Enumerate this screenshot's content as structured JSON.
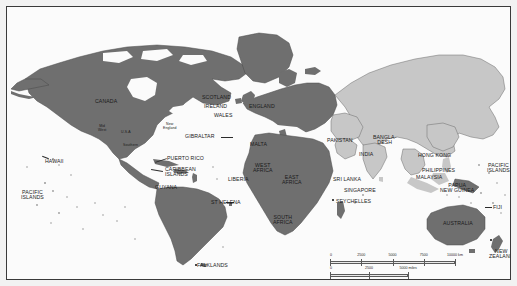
{
  "figure": {
    "name": "world-map",
    "kind": "map",
    "projection_note": "equirectangular world map",
    "colors": {
      "land_dark": "#6f6f6f",
      "land_light": "#c7c7c7",
      "ocean": "#fbfbfb",
      "outline": "#4a4a4a",
      "label_text": "#1a1a1a",
      "frame": "#3a3a3a",
      "page_background": "#f2f2f2"
    }
  },
  "labels": [
    {
      "id": "canada",
      "text": "CANADA",
      "style": "caps"
    },
    {
      "id": "usa",
      "text": "U.S.A",
      "style": "xs"
    },
    {
      "id": "mid-west",
      "text": "Mid\nWest",
      "style": "xs"
    },
    {
      "id": "new-england",
      "text": "New\nEngland",
      "style": "xs"
    },
    {
      "id": "southern",
      "text": "Southern",
      "style": "xs"
    },
    {
      "id": "hawaii",
      "text": "HAWAII",
      "style": "caps"
    },
    {
      "id": "pacific-islands-e",
      "text": "PACIFIC\nISLANDS",
      "style": "caps"
    },
    {
      "id": "puerto-rico",
      "text": "PUERTO RICO",
      "style": "caps"
    },
    {
      "id": "caribbean-islands",
      "text": "CARIBBEAN\nISLANDS",
      "style": "caps"
    },
    {
      "id": "guyana",
      "text": "GUYANA",
      "style": "caps"
    },
    {
      "id": "falklands",
      "text": "FALKLANDS",
      "style": "caps"
    },
    {
      "id": "scotland",
      "text": "SCOTLAND",
      "style": "caps"
    },
    {
      "id": "ireland",
      "text": "IRELAND",
      "style": "caps"
    },
    {
      "id": "wales",
      "text": "WALES",
      "style": "caps"
    },
    {
      "id": "england",
      "text": "ENGLAND",
      "style": "caps"
    },
    {
      "id": "gibraltar",
      "text": "GIBRALTAR",
      "style": "caps"
    },
    {
      "id": "malta",
      "text": "MALTA",
      "style": "caps"
    },
    {
      "id": "st-helena",
      "text": "ST HELENA",
      "style": "caps"
    },
    {
      "id": "liberia",
      "text": "LIBERIA",
      "style": "caps"
    },
    {
      "id": "west-africa",
      "text": "WEST\nAFRICA",
      "style": "caps"
    },
    {
      "id": "east-africa",
      "text": "EAST\nAFRICA",
      "style": "caps"
    },
    {
      "id": "south-africa",
      "text": "SOUTH\nAFRICA",
      "style": "caps"
    },
    {
      "id": "seychelles",
      "text": "SEYCHELLES",
      "style": "caps"
    },
    {
      "id": "pakistan",
      "text": "PAKISTAN",
      "style": "caps"
    },
    {
      "id": "india",
      "text": "INDIA",
      "style": "caps"
    },
    {
      "id": "bangladesh",
      "text": "BANGLA-\nDESH",
      "style": "caps"
    },
    {
      "id": "sri-lanka",
      "text": "SRI LANKA",
      "style": "caps"
    },
    {
      "id": "singapore",
      "text": "SINGAPORE",
      "style": "caps"
    },
    {
      "id": "malaysia",
      "text": "MALAYSIA",
      "style": "caps"
    },
    {
      "id": "hong-kong",
      "text": "HONG KONG",
      "style": "caps"
    },
    {
      "id": "philippines",
      "text": "PHILIPPINES",
      "style": "caps"
    },
    {
      "id": "papua-new-guinea",
      "text": "PAPUA\nNEW GUINEA",
      "style": "caps"
    },
    {
      "id": "pacific-islands-w",
      "text": "PACIFIC\nISLANDS",
      "style": "caps"
    },
    {
      "id": "fiji",
      "text": "FIJI",
      "style": "caps"
    },
    {
      "id": "australia",
      "text": "AUSTRALIA",
      "style": "caps"
    },
    {
      "id": "new-zealand",
      "text": "NEW\nZEALAND",
      "style": "caps"
    }
  ],
  "scale": {
    "name": "map-scale",
    "km": {
      "unit_label": "10000 km",
      "ticks": [
        "0",
        "2500",
        "5000",
        "7500"
      ],
      "max": 10000
    },
    "miles": {
      "unit_label": "5000 miles",
      "ticks": [
        "0",
        "2500"
      ],
      "max": 5000
    }
  }
}
